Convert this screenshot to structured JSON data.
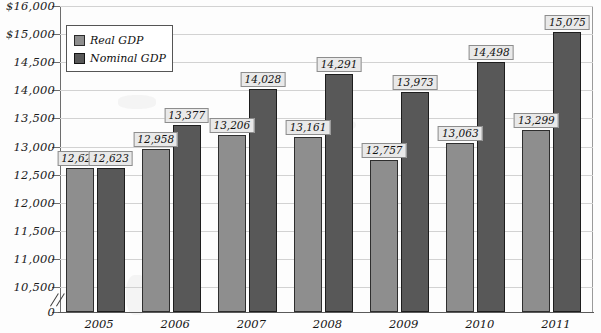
{
  "chart_data": {
    "type": "bar",
    "title": "",
    "xlabel": "",
    "ylabel": "",
    "categories": [
      "2005",
      "2006",
      "2007",
      "2008",
      "2009",
      "2010",
      "2011"
    ],
    "series": [
      {
        "name": "Real GDP",
        "color": "#8e8e8e",
        "values": [
          12623,
          12958,
          13206,
          13161,
          12757,
          13063,
          13299
        ],
        "labels": [
          "12,623",
          "12,958",
          "13,206",
          "13,161",
          "12,757",
          "13,063",
          "13,299"
        ]
      },
      {
        "name": "Nominal GDP",
        "color": "#585858",
        "values": [
          12623,
          13377,
          14028,
          14291,
          13973,
          14498,
          15075
        ],
        "labels": [
          "12,623",
          "13,377",
          "14,028",
          "14,291",
          "13,973",
          "14,498",
          "15,075"
        ]
      }
    ],
    "yticks": [
      "$16,000",
      "$15,000",
      "14,500",
      "14,000",
      "13,500",
      "13,000",
      "12,500",
      "12,000",
      "11,500",
      "11,000",
      "10,500",
      "0"
    ],
    "ytick_values": [
      16000,
      15000,
      14500,
      14000,
      13500,
      13000,
      12500,
      12000,
      11500,
      11000,
      10500,
      0
    ],
    "ylim": [
      10500,
      16000
    ],
    "axis_break": true,
    "grid": true,
    "legend_position": "top-left",
    "legend": [
      "Real GDP",
      "Nominal GDP"
    ]
  },
  "legend": {
    "items": [
      {
        "label": "Real GDP"
      },
      {
        "label": "Nominal GDP"
      }
    ]
  }
}
